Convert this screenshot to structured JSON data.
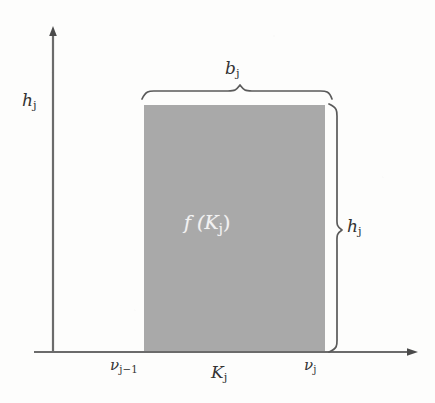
{
  "figure": {
    "type": "mathematical-diagram",
    "background_color": "#fdfdfc",
    "ink_color": "#555555",
    "bar_fill_color": "#a9a9a9",
    "bar_label_color": "#f2f2f2"
  },
  "axes": {
    "y_axis_label": "h",
    "y_axis_label_sub": "j",
    "x_axis_origin_x": 53,
    "x_axis_y": 352,
    "y_axis_top_y": 28,
    "x_axis_right_x": 416,
    "arrowheads": [
      "y-axis-up",
      "x-axis-right"
    ]
  },
  "bar": {
    "left_x": 144,
    "right_x": 325,
    "top_y": 105,
    "bottom_y": 352,
    "area_label": "f (K",
    "area_label_sub": "j",
    "area_label_tail": ")"
  },
  "annotations": {
    "width_brace_label": "b",
    "width_brace_label_sub": "j",
    "height_brace_label": "h",
    "height_brace_label_sub": "j",
    "tick_left_label": "ν",
    "tick_left_label_sub": "j−1",
    "tick_right_label": "ν",
    "tick_right_label_sub": "j",
    "interval_label": "K",
    "interval_label_sub": "j"
  }
}
